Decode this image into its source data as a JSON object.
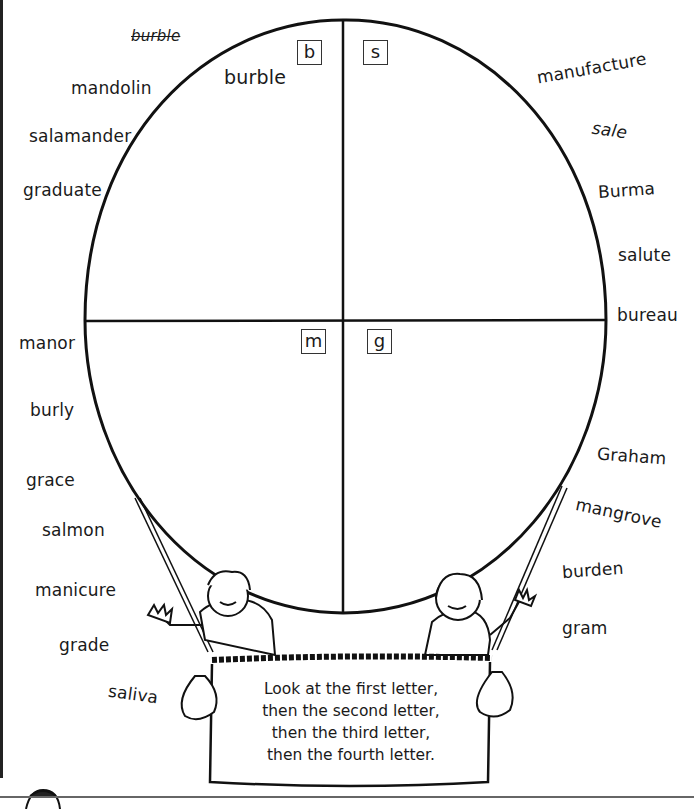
{
  "worksheet": {
    "instruction_lines": [
      "Look at the first letter,",
      "then the second letter,",
      "then the third letter,",
      "then the fourth letter."
    ],
    "example": {
      "crossed_out_word": "burble",
      "placed_word": "burble"
    },
    "quadrants": {
      "top_left": "b",
      "top_right": "s",
      "bottom_left": "m",
      "bottom_right": "g"
    },
    "words_left": [
      "mandolin",
      "salamander",
      "graduate",
      "manor",
      "burly",
      "grace",
      "salmon",
      "manicure",
      "grade",
      "saliva"
    ],
    "words_right": [
      "manufacture",
      "sale",
      "Burma",
      "salute",
      "bureau",
      "Graham",
      "mangrove",
      "burden",
      "gram"
    ]
  }
}
